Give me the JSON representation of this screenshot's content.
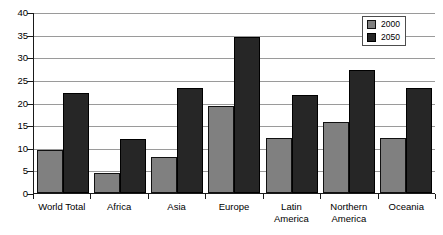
{
  "chart_data": {
    "type": "bar",
    "title": "",
    "xlabel": "",
    "ylabel": "",
    "ylim": [
      0,
      40
    ],
    "ytick_step": 5,
    "yticks": [
      0,
      5,
      10,
      15,
      20,
      25,
      30,
      35,
      40
    ],
    "grid": true,
    "legend_position": "top-right",
    "categories": [
      "World Total",
      "Africa",
      "Asia",
      "Europe",
      "Latin\nAmerica",
      "Northern\nAmerica",
      "Oceania"
    ],
    "series": [
      {
        "name": "2000",
        "color": "#808080",
        "values": [
          9.5,
          4.4,
          7.9,
          19.2,
          12.2,
          15.6,
          12.1
        ]
      },
      {
        "name": "2050",
        "color": "#262626",
        "values": [
          22.0,
          12.0,
          23.3,
          34.4,
          21.7,
          27.2,
          23.1
        ]
      }
    ]
  },
  "legend": {
    "items": [
      {
        "label": "2000"
      },
      {
        "label": "2050"
      }
    ]
  },
  "colors": {
    "series_2000": "#808080",
    "series_2050": "#262626",
    "axis": "#1a1a1a",
    "gridline": "#9a9a9a",
    "background": "#ffffff"
  }
}
